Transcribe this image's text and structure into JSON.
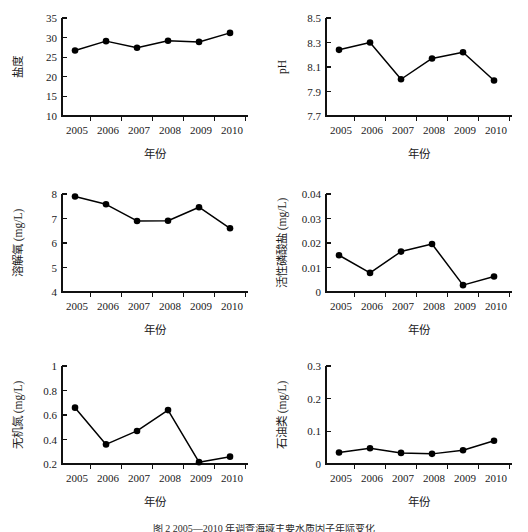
{
  "figure": {
    "background": "#ffffff",
    "line_color": "#000000",
    "text_color": "#1a1a1a",
    "caption": "图 2  2005—2010 年调查海域主要水质因子年际变化"
  },
  "chart_data": [
    {
      "id": "salinity",
      "type": "line",
      "title": "",
      "xlabel": "年份",
      "ylabel": "盐度",
      "categories": [
        "2005",
        "2006",
        "2007",
        "2008",
        "2009",
        "2010"
      ],
      "values": [
        26.7,
        29.1,
        27.4,
        29.2,
        28.9,
        31.2
      ],
      "ylim": [
        10,
        35
      ],
      "yticks": [
        10,
        15,
        20,
        25,
        30,
        35
      ],
      "ytick_labels": [
        "10",
        "15",
        "20",
        "25",
        "30",
        "35"
      ],
      "grid": false,
      "legend": "none",
      "marker": "filled-circle"
    },
    {
      "id": "ph",
      "type": "line",
      "title": "",
      "xlabel": "年份",
      "ylabel": "pH",
      "categories": [
        "2005",
        "2006",
        "2007",
        "2008",
        "2009",
        "2010"
      ],
      "values": [
        8.24,
        8.3,
        8.0,
        8.17,
        8.22,
        7.99
      ],
      "ylim": [
        7.7,
        8.5
      ],
      "yticks": [
        7.7,
        7.9,
        8.1,
        8.3,
        8.5
      ],
      "ytick_labels": [
        "7.7",
        "7.9",
        "8.1",
        "8.3",
        "8.5"
      ],
      "grid": false,
      "legend": "none",
      "marker": "filled-circle"
    },
    {
      "id": "dissolved-oxygen",
      "type": "line",
      "title": "",
      "xlabel": "年份",
      "ylabel": "溶解氧 (mg/L)",
      "categories": [
        "2005",
        "2006",
        "2007",
        "2008",
        "2009",
        "2010"
      ],
      "values": [
        7.9,
        7.58,
        6.9,
        6.91,
        7.46,
        6.6
      ],
      "ylim": [
        4,
        8
      ],
      "yticks": [
        4,
        5,
        6,
        7,
        8
      ],
      "ytick_labels": [
        "4",
        "5",
        "6",
        "7",
        "8"
      ],
      "grid": false,
      "legend": "none",
      "marker": "filled-circle"
    },
    {
      "id": "active-phosphate",
      "type": "line",
      "title": "",
      "xlabel": "年份",
      "ylabel": "活性磷酸盐 (mg/L)",
      "categories": [
        "2005",
        "2006",
        "2007",
        "2008",
        "2009",
        "2010"
      ],
      "values": [
        0.015,
        0.0078,
        0.0165,
        0.0196,
        0.0028,
        0.0063
      ],
      "ylim": [
        0,
        0.04
      ],
      "yticks": [
        0,
        0.01,
        0.02,
        0.03,
        0.04
      ],
      "ytick_labels": [
        "0",
        "0.01",
        "0.02",
        "0.03",
        "0.04"
      ],
      "grid": false,
      "legend": "none",
      "marker": "filled-circle"
    },
    {
      "id": "inorganic-nitrogen",
      "type": "line",
      "title": "",
      "xlabel": "年份",
      "ylabel": "无机氮 (mg/L)",
      "categories": [
        "2005",
        "2006",
        "2007",
        "2008",
        "2009",
        "2010"
      ],
      "values": [
        0.66,
        0.36,
        0.47,
        0.64,
        0.215,
        0.26
      ],
      "ylim": [
        0.2,
        1.0
      ],
      "yticks": [
        0.2,
        0.4,
        0.6,
        0.8,
        1.0
      ],
      "ytick_labels": [
        "0.2",
        "0.4",
        "0.6",
        "0.8",
        "1"
      ],
      "grid": false,
      "legend": "none",
      "marker": "filled-circle"
    },
    {
      "id": "petroleum",
      "type": "line",
      "title": "",
      "xlabel": "年份",
      "ylabel": "石油类 (mg/L)",
      "categories": [
        "2005",
        "2006",
        "2007",
        "2008",
        "2009",
        "2010"
      ],
      "values": [
        0.035,
        0.048,
        0.034,
        0.031,
        0.042,
        0.071
      ],
      "ylim": [
        0,
        0.3
      ],
      "yticks": [
        0,
        0.1,
        0.2,
        0.3
      ],
      "ytick_labels": [
        "0",
        "0.1",
        "0.2",
        "0.3"
      ],
      "grid": false,
      "legend": "none",
      "marker": "filled-circle"
    }
  ]
}
